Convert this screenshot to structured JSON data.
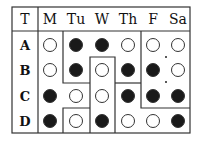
{
  "header": {
    "corner": "T",
    "columns": [
      "M",
      "Tu",
      "W",
      "Th",
      "F",
      "Sa"
    ]
  },
  "rows": [
    {
      "label": "A",
      "cells": [
        "empty",
        "filled",
        "filled",
        "empty",
        "empty",
        "empty"
      ]
    },
    {
      "label": "B",
      "cells": [
        "empty",
        "filled",
        "empty",
        "filled",
        "filled",
        "empty"
      ]
    },
    {
      "label": "C",
      "cells": [
        "filled",
        "empty",
        "empty",
        "filled",
        "filled",
        "filled"
      ]
    },
    {
      "label": "D",
      "cells": [
        "filled",
        "empty",
        "filled",
        "empty",
        "empty",
        "filled"
      ]
    }
  ],
  "colors": {
    "line": "#333333",
    "filled": "#1a1a1a",
    "empty_fill": "#ffffff"
  }
}
